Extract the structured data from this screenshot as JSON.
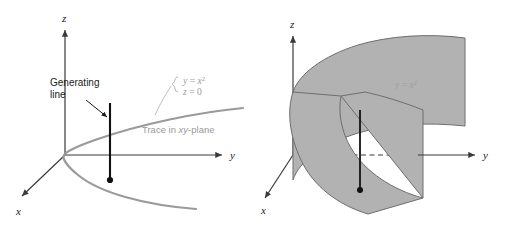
{
  "figure": {
    "background_color": "#ffffff"
  },
  "colors": {
    "axis": "#3a3a3a",
    "curve_gray": "#9a9a9a",
    "surface_fill": "#b2b2b2",
    "surface_edge": "#6e6e6e",
    "generating_line": "#111111",
    "text_black": "#1a1a1a",
    "text_gray": "#9a9a9a",
    "surface_label": "#9d9d9d"
  },
  "left_panel": {
    "name": "trace-in-xy-plane-diagram",
    "axes": [
      {
        "id": "z",
        "label": "z"
      },
      {
        "id": "y",
        "label": "y"
      },
      {
        "id": "x",
        "label": "x"
      }
    ],
    "annotations": {
      "generating_line_label_line1": "Generating",
      "generating_line_label_line2": "line",
      "equation_line1_lhs": "y",
      "equation_line1_rel": "=",
      "equation_line1_rhs": "x",
      "equation_line1_exponent": "2",
      "equation_line2_lhs": "z",
      "equation_line2_rel": "=",
      "equation_line2_rhs": "0",
      "trace_label_prefix": "Trace in ",
      "trace_label_italic": "xy",
      "trace_label_suffix": "-plane"
    },
    "elements": {
      "generating_line": "vertical black segment through the curve",
      "point_marker": "black dot at lower end of generating line",
      "parabola": "gray parabola opening along positive y"
    }
  },
  "right_panel": {
    "name": "parabolic-cylinder-surface-diagram",
    "axes": [
      {
        "id": "z",
        "label": "z"
      },
      {
        "id": "y",
        "label": "y"
      },
      {
        "id": "x",
        "label": "x"
      }
    ],
    "annotations": {
      "surface_equation_lhs": "y",
      "surface_equation_rel": "=",
      "surface_equation_rhs": "x",
      "surface_equation_exponent": "2"
    },
    "elements": {
      "surface": "shaded parabolic cylinder",
      "generating_line": "vertical black segment on the surface",
      "point_marker": "black dot at lower end of generating line",
      "hidden_axis_style": "dashed where y-axis passes behind surface"
    }
  }
}
